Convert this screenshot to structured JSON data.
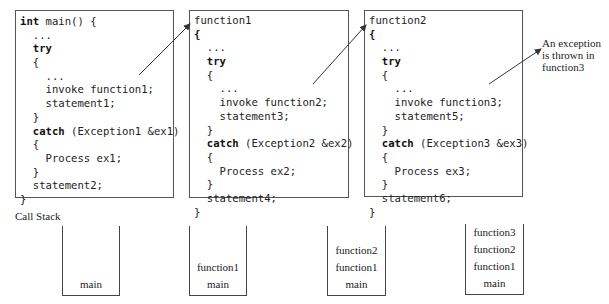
{
  "code_boxes": [
    {
      "name": "main",
      "lines": [
        {
          "indent": 0,
          "kw": "int",
          "rest": " main() {"
        },
        {
          "indent": 1,
          "kw": "",
          "rest": "..."
        },
        {
          "indent": 1,
          "kw": "try",
          "rest": ""
        },
        {
          "indent": 1,
          "kw": "",
          "rest": "{"
        },
        {
          "indent": 2,
          "kw": "",
          "rest": "..."
        },
        {
          "indent": 2,
          "kw": "",
          "rest": "invoke function1;"
        },
        {
          "indent": 2,
          "kw": "",
          "rest": "statement1;"
        },
        {
          "indent": 1,
          "kw": "",
          "rest": "}"
        },
        {
          "indent": 1,
          "kw": "catch",
          "rest": " (Exception1 &ex1)"
        },
        {
          "indent": 1,
          "kw": "",
          "rest": "{"
        },
        {
          "indent": 2,
          "kw": "",
          "rest": "Process ex1;"
        },
        {
          "indent": 1,
          "kw": "",
          "rest": "}"
        },
        {
          "indent": 1,
          "kw": "",
          "rest": "statement2;"
        },
        {
          "indent": 0,
          "kw": "",
          "rest": "}"
        }
      ]
    },
    {
      "name": "function1",
      "lines": [
        {
          "indent": 0,
          "kw": "",
          "rest": "function1"
        },
        {
          "indent": 0,
          "kw": "{",
          "rest": ""
        },
        {
          "indent": 1,
          "kw": "",
          "rest": "..."
        },
        {
          "indent": 1,
          "kw": "try",
          "rest": ""
        },
        {
          "indent": 1,
          "kw": "",
          "rest": "{"
        },
        {
          "indent": 2,
          "kw": "",
          "rest": "..."
        },
        {
          "indent": 2,
          "kw": "",
          "rest": "invoke function2;"
        },
        {
          "indent": 2,
          "kw": "",
          "rest": "statement3;"
        },
        {
          "indent": 1,
          "kw": "",
          "rest": "}"
        },
        {
          "indent": 1,
          "kw": "catch",
          "rest": " (Exception2 &ex2)"
        },
        {
          "indent": 1,
          "kw": "",
          "rest": "{"
        },
        {
          "indent": 2,
          "kw": "",
          "rest": "Process ex2;"
        },
        {
          "indent": 1,
          "kw": "",
          "rest": "}"
        },
        {
          "indent": 1,
          "kw": "",
          "rest": "statement4;"
        },
        {
          "indent": 0,
          "kw": "",
          "rest": "}"
        }
      ]
    },
    {
      "name": "function2",
      "lines": [
        {
          "indent": 0,
          "kw": "",
          "rest": "function2"
        },
        {
          "indent": 0,
          "kw": "{",
          "rest": ""
        },
        {
          "indent": 1,
          "kw": "",
          "rest": "..."
        },
        {
          "indent": 1,
          "kw": "try",
          "rest": ""
        },
        {
          "indent": 1,
          "kw": "",
          "rest": "{"
        },
        {
          "indent": 2,
          "kw": "",
          "rest": "..."
        },
        {
          "indent": 2,
          "kw": "",
          "rest": "invoke function3;"
        },
        {
          "indent": 2,
          "kw": "",
          "rest": "statement5;"
        },
        {
          "indent": 1,
          "kw": "",
          "rest": "}"
        },
        {
          "indent": 1,
          "kw": "catch",
          "rest": " (Exception3 &ex3)"
        },
        {
          "indent": 1,
          "kw": "",
          "rest": "{"
        },
        {
          "indent": 2,
          "kw": "",
          "rest": "Process ex3;"
        },
        {
          "indent": 1,
          "kw": "",
          "rest": "}"
        },
        {
          "indent": 1,
          "kw": "",
          "rest": "statement6;"
        },
        {
          "indent": 0,
          "kw": "",
          "rest": "}"
        }
      ]
    }
  ],
  "annotation": {
    "lines": [
      "An exception",
      "is thrown in",
      "function3"
    ]
  },
  "call_stack": {
    "label": "Call Stack",
    "stacks": [
      {
        "frames_bottom_to_top": [
          "main"
        ]
      },
      {
        "frames_bottom_to_top": [
          "main",
          "function1"
        ]
      },
      {
        "frames_bottom_to_top": [
          "main",
          "function1",
          "function2"
        ]
      },
      {
        "frames_bottom_to_top": [
          "main",
          "function1",
          "function2",
          "function3"
        ]
      }
    ]
  },
  "colors": {
    "stroke": "#444444",
    "text": "#222222",
    "background": "#ffffff"
  }
}
